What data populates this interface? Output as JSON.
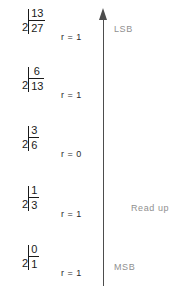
{
  "diagram": {
    "divisor_symbol": "2",
    "remainder_prefix": "r =",
    "arrow": {
      "name": "read-up-arrow",
      "direction": "up",
      "color": "#4d4d4d"
    },
    "labels": {
      "lsb": "LSB",
      "msb": "MSB",
      "read_direction": "Read  up"
    },
    "math_color": "#1a1a1a",
    "label_color": "#8f8f8f",
    "steps": [
      {
        "quotient": "13",
        "divisor": "2",
        "dividend": "27",
        "remainder": "r = 1",
        "bit_label": "LSB"
      },
      {
        "quotient": "6",
        "divisor": "2",
        "dividend": "13",
        "remainder": "r = 1",
        "bit_label": ""
      },
      {
        "quotient": "3",
        "divisor": "2",
        "dividend": "6",
        "remainder": "r = 0",
        "bit_label": ""
      },
      {
        "quotient": "1",
        "divisor": "2",
        "dividend": "3",
        "remainder": "r = 1",
        "bit_label": ""
      },
      {
        "quotient": "0",
        "divisor": "2",
        "dividend": "1",
        "remainder": "r = 1",
        "bit_label": "MSB"
      }
    ]
  }
}
